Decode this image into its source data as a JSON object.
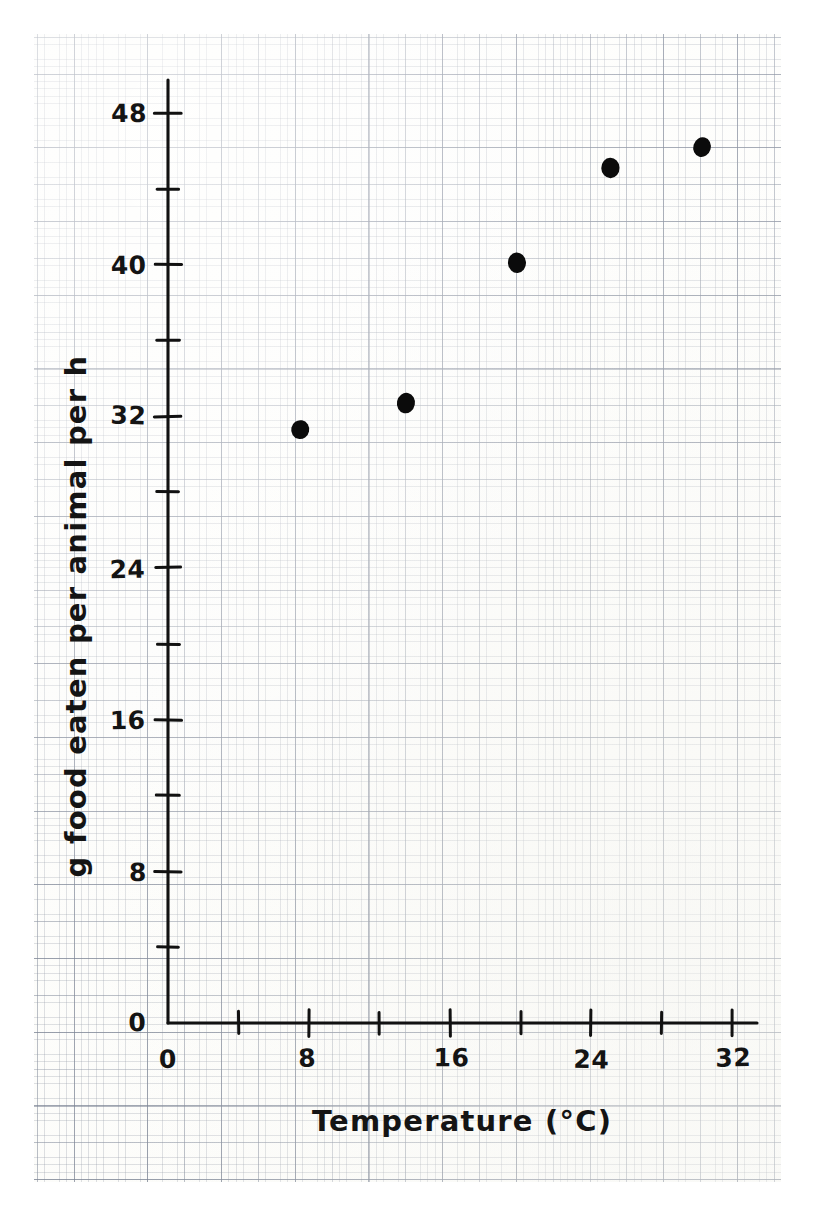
{
  "figure": {
    "kind": "hand-drawn-scatter-on-graph-paper",
    "background_color": "#fdfdfb",
    "ink_color": "#111111"
  },
  "chart_data": {
    "type": "scatter",
    "title": "",
    "xlabel": "Temperature (°C)",
    "ylabel": "g food eaten per animal per h",
    "xlim": [
      0,
      34
    ],
    "ylim": [
      0,
      50
    ],
    "grid": true,
    "legend": null,
    "x_ticks_major": [
      0,
      8,
      16,
      24,
      32
    ],
    "x_ticks_minor": [
      4,
      12,
      20,
      28
    ],
    "y_ticks_major": [
      0,
      8,
      16,
      24,
      32,
      40,
      48
    ],
    "y_ticks_minor": [
      4,
      12,
      20,
      28,
      36,
      44
    ],
    "x_tick_labels": [
      "0",
      "8",
      "16",
      "24",
      "32"
    ],
    "y_tick_labels": [
      "0",
      "8",
      "16",
      "24",
      "32",
      "40",
      "48"
    ],
    "points": [
      {
        "x": 7.5,
        "y": 31.3
      },
      {
        "x": 13.5,
        "y": 32.7
      },
      {
        "x": 19.8,
        "y": 40.1
      },
      {
        "x": 25.1,
        "y": 45.1
      },
      {
        "x": 30.3,
        "y": 46.2
      }
    ],
    "marker": "filled-circle",
    "marker_color": "#0b0b0b"
  },
  "axes": {
    "x_axis_name": "x-axis",
    "y_axis_name": "y-axis",
    "x_title": "Temperature (°C)",
    "y_title": "g food eaten per animal per h",
    "origin_label": "0"
  }
}
